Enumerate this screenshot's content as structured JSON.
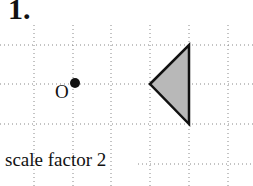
{
  "question_number": "1.",
  "center_label": "O",
  "caption": "scale factor 2",
  "grid": {
    "vertical_x": [
      34,
      73,
      111,
      150,
      189,
      228
    ],
    "horizontal_y": [
      45,
      84,
      124,
      164
    ],
    "dot_color": "#888888"
  },
  "center_point": {
    "x": 75,
    "y": 83
  },
  "triangle": {
    "vertices": [
      [
        150,
        84
      ],
      [
        189,
        45
      ],
      [
        189,
        124
      ]
    ],
    "fill": "#b8b8b8",
    "stroke": "#111111"
  }
}
